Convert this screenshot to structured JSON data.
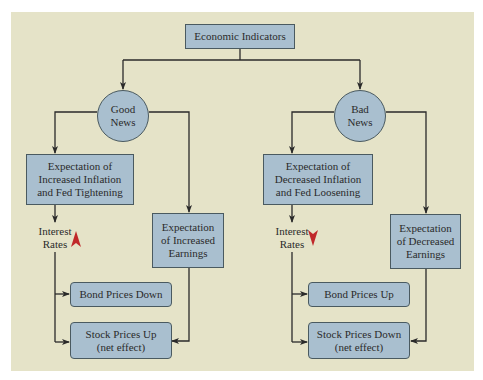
{
  "diagram": {
    "root": {
      "label": "Economic Indicators"
    },
    "branches": [
      {
        "node": {
          "line1": "Good",
          "line2": "News"
        },
        "expectation": {
          "line1": "Expectation of",
          "line2": "Increased Inflation",
          "line3": "and Fed Tightening"
        },
        "interest": {
          "line1": "Interest",
          "line2": "Rates",
          "direction": "up",
          "arrow_color": "#c0282a"
        },
        "earnings": {
          "line1": "Expectation",
          "line2": "of Increased",
          "line3": "Earnings"
        },
        "bond": {
          "label": "Bond Prices Down"
        },
        "stock": {
          "line1": "Stock Prices Up",
          "line2": "(net effect)"
        }
      },
      {
        "node": {
          "line1": "Bad",
          "line2": "News"
        },
        "expectation": {
          "line1": "Expectation of",
          "line2": "Decreased Inflation",
          "line3": "and Fed Loosening"
        },
        "interest": {
          "line1": "Interest",
          "line2": "Rates",
          "direction": "down",
          "arrow_color": "#c0282a"
        },
        "earnings": {
          "line1": "Expectation",
          "line2": "of Decreased",
          "line3": "Earnings"
        },
        "bond": {
          "label": "Bond Prices Up"
        },
        "stock": {
          "line1": "Stock Prices Down",
          "line2": "(net effect)"
        }
      }
    ]
  },
  "colors": {
    "background": "#e5e3c8",
    "box_fill": "#a9bfcf",
    "box_border": "#4a5a60",
    "line": "#2a2a2a",
    "accent_arrow": "#c0282a"
  }
}
